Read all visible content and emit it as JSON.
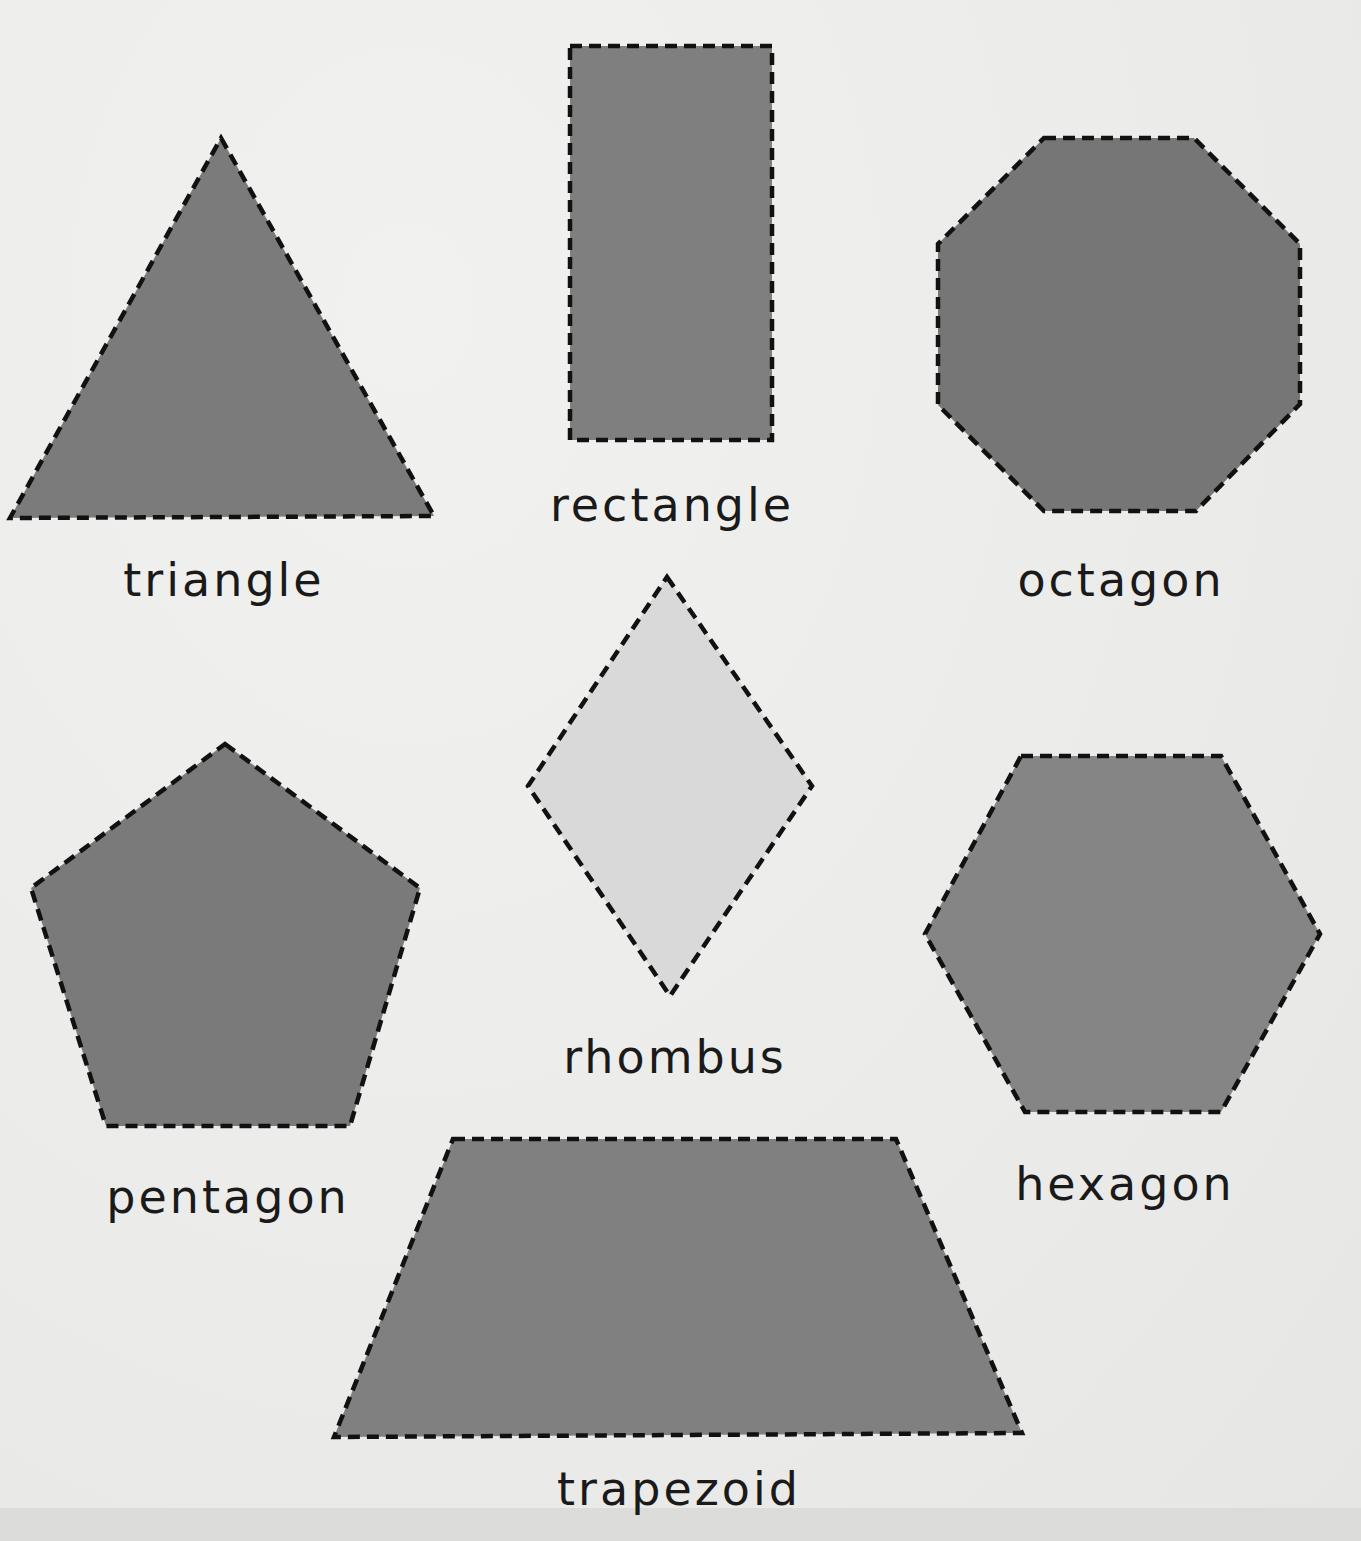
{
  "page": {
    "colors": {
      "background": "#ededeb",
      "dark_fill": "#7a7a7a",
      "light_fill": "#d9d9d9",
      "outline": "#111111",
      "text": "#1a1a1a"
    }
  },
  "shapes": [
    {
      "id": "triangle",
      "label": "triangle",
      "fill": "dark"
    },
    {
      "id": "rectangle",
      "label": "rectangle",
      "fill": "dark"
    },
    {
      "id": "octagon",
      "label": "octagon",
      "fill": "dark"
    },
    {
      "id": "rhombus",
      "label": "rhombus",
      "fill": "light"
    },
    {
      "id": "pentagon",
      "label": "pentagon",
      "fill": "dark"
    },
    {
      "id": "hexagon",
      "label": "hexagon",
      "fill": "dark"
    },
    {
      "id": "trapezoid",
      "label": "trapezoid",
      "fill": "dark"
    }
  ]
}
